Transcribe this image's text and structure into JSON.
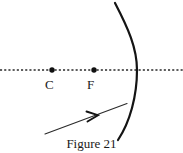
{
  "figure": {
    "caption": "Figure 21",
    "type": "optics-ray-diagram",
    "canvas": {
      "width": 183,
      "height": 153,
      "background": "#ffffff"
    },
    "stroke_color": "#1a1a1a",
    "axis": {
      "name": "principal-axis",
      "style": "dotted",
      "y": 70,
      "x_start": 0,
      "x_end": 183,
      "dash_pattern": "2,2",
      "stroke_width": 1.2
    },
    "points": [
      {
        "id": "center-of-curvature",
        "label": "C",
        "dot_x": 52,
        "dot_y": 70,
        "dot_radius": 2.6,
        "label_x": 45,
        "label_y": 78
      },
      {
        "id": "focal-point",
        "label": "F",
        "dot_x": 94,
        "dot_y": 70,
        "dot_radius": 2.6,
        "label_x": 87,
        "label_y": 78
      }
    ],
    "mirror": {
      "name": "concave-mirror-arc",
      "description": "curved mirror arc, vertex on axis at right",
      "vertex_x": 137,
      "vertex_y": 70,
      "top_x": 115,
      "top_y": 3,
      "bottom_x": 118,
      "bottom_y": 140,
      "stroke_width": 2.1
    },
    "incident_ray": {
      "name": "incident-ray",
      "tail_x": 45,
      "tail_y": 134,
      "head_x": 126,
      "head_y": 104,
      "stroke_width": 1.1,
      "arrowhead": {
        "tip_x": 97,
        "tip_y": 115,
        "style": "open-chevron"
      }
    }
  }
}
